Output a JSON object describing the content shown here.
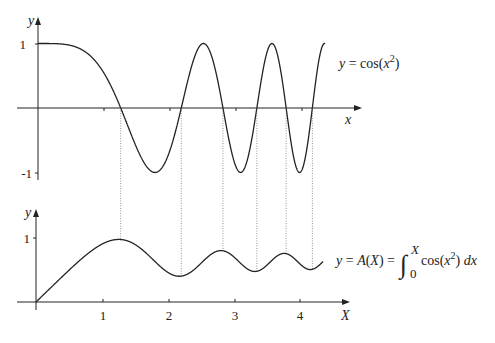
{
  "chart_data": [
    {
      "type": "line",
      "title": "",
      "series": [
        {
          "name": "y = cos(x²)",
          "function": "cos(x^2)",
          "x_range": [
            0,
            4.35
          ]
        }
      ],
      "xlabel": "x",
      "ylabel": "y",
      "yticks": [
        "1",
        "-1"
      ],
      "ylim": [
        -1,
        1
      ],
      "xlim": [
        0,
        4.5
      ],
      "label": "y = cos(x²)",
      "zeros_marked": [
        1.2533,
        2.1708,
        2.8025,
        3.316,
        3.7599,
        4.1573
      ]
    },
    {
      "type": "line",
      "title": "",
      "series": [
        {
          "name": "y = A(X) = ∫₀ˣ cos(x²) dx",
          "function": "integral_0^X cos(x^2) dx",
          "x_range": [
            0,
            4.35
          ]
        }
      ],
      "xlabel": "X",
      "ylabel": "y",
      "xticks": [
        "1",
        "2",
        "3",
        "4"
      ],
      "yticks": [
        "1"
      ],
      "ylim": [
        0,
        1
      ],
      "xlim": [
        0,
        4.5
      ],
      "label_parts": {
        "lhs": "y = A(X) = ",
        "integral_upper": "X",
        "integral_lower": "0",
        "integrand": "cos(x²) dx"
      },
      "extrema": [
        {
          "X": 1.2533,
          "y": 0.977
        },
        {
          "X": 2.1708,
          "y": 0.389
        },
        {
          "X": 2.8025,
          "y": 0.795
        },
        {
          "X": 3.316,
          "y": 0.422
        },
        {
          "X": 3.7599,
          "y": 0.753
        },
        {
          "X": 4.1573,
          "y": 0.469
        }
      ]
    }
  ],
  "top": {
    "y_axis_label": "y",
    "x_axis_label": "x",
    "tick_1": "1",
    "tick_neg1": "-1",
    "curve_label": "y = cos(x²)"
  },
  "bottom": {
    "y_axis_label": "y",
    "x_axis_label": "X",
    "tick_1": "1",
    "xticks": [
      "1",
      "2",
      "3",
      "4"
    ],
    "label_lhs": "y = A(X) =",
    "label_upper": "X",
    "label_lower": "0",
    "label_integrand": "cos(x²) dx"
  }
}
